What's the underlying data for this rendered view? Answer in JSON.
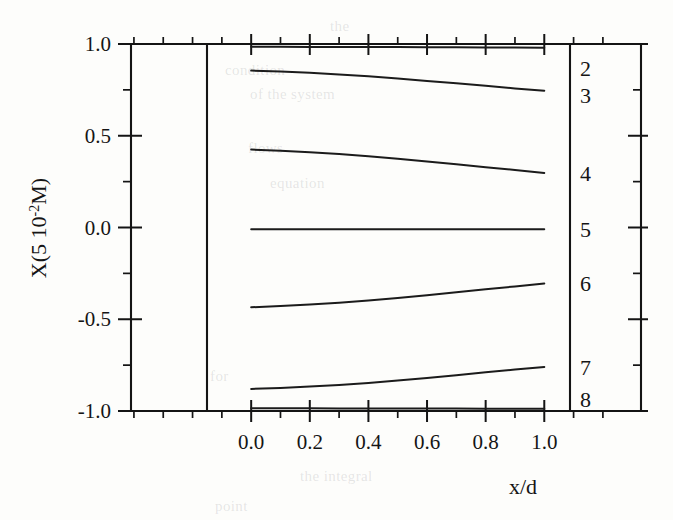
{
  "chart_data": {
    "type": "line",
    "title": "",
    "xlabel": "x/d",
    "ylabel": "X(5 10-2M)",
    "ylabel_parts": {
      "pre": "X(5 10",
      "sup": "-2",
      "post": "M)"
    },
    "xlim": [
      -0.41,
      1.33
    ],
    "ylim": [
      -1.0,
      1.0
    ],
    "x_data_range": [
      0.0,
      1.0
    ],
    "xticks": [
      0.0,
      0.2,
      0.4,
      0.6,
      0.8,
      1.0
    ],
    "xtick_labels": [
      "0.0",
      "0.2",
      "0.4",
      "0.6",
      "0.8",
      "1.0"
    ],
    "x_minor_ticks": [
      -0.4,
      -0.3,
      -0.2,
      -0.1,
      0.1,
      0.3,
      0.5,
      0.7,
      0.9,
      1.1,
      1.2
    ],
    "yticks": [
      -1.0,
      -0.5,
      0.0,
      0.5,
      1.0
    ],
    "ytick_labels": [
      "-1.0",
      "-0.5",
      "0.0",
      "0.5",
      "1.0"
    ],
    "y_minor_ticks": [
      -0.75,
      -0.25,
      0.25,
      0.75
    ],
    "grid": false,
    "legend_position": "right-inline-labels",
    "x": [
      0.0,
      0.1,
      0.2,
      0.3,
      0.4,
      0.5,
      0.6,
      0.7,
      0.8,
      0.9,
      1.0
    ],
    "series": [
      {
        "name": "2",
        "label": "2",
        "values": [
          0.985,
          0.985,
          0.984,
          0.984,
          0.983,
          0.983,
          0.982,
          0.982,
          0.981,
          0.981,
          0.98
        ]
      },
      {
        "name": "3",
        "label": "3",
        "values": [
          0.855,
          0.85,
          0.843,
          0.834,
          0.824,
          0.812,
          0.799,
          0.786,
          0.772,
          0.758,
          0.745
        ]
      },
      {
        "name": "4",
        "label": "4",
        "values": [
          0.425,
          0.418,
          0.41,
          0.4,
          0.388,
          0.375,
          0.36,
          0.345,
          0.329,
          0.313,
          0.297
        ]
      },
      {
        "name": "5",
        "label": "5",
        "values": [
          -0.01,
          -0.01,
          -0.01,
          -0.01,
          -0.01,
          -0.01,
          -0.01,
          -0.01,
          -0.01,
          -0.01,
          -0.01
        ]
      },
      {
        "name": "6",
        "label": "6",
        "values": [
          -0.435,
          -0.428,
          -0.42,
          -0.41,
          -0.398,
          -0.384,
          -0.369,
          -0.353,
          -0.337,
          -0.321,
          -0.305
        ]
      },
      {
        "name": "7",
        "label": "7",
        "values": [
          -0.88,
          -0.874,
          -0.867,
          -0.858,
          -0.847,
          -0.834,
          -0.82,
          -0.805,
          -0.789,
          -0.774,
          -0.76
        ]
      },
      {
        "name": "8",
        "label": "8",
        "values": [
          -0.985,
          -0.985,
          -0.985,
          -0.986,
          -0.986,
          -0.986,
          -0.987,
          -0.987,
          -0.988,
          -0.988,
          -0.988
        ]
      }
    ]
  },
  "background_text": [
    {
      "text": "the",
      "x": 330,
      "y": 18
    },
    {
      "text": "condition",
      "x": 225,
      "y": 62
    },
    {
      "text": "of the system",
      "x": 250,
      "y": 86
    },
    {
      "text": "flows",
      "x": 248,
      "y": 140
    },
    {
      "text": "equation",
      "x": 270,
      "y": 175
    },
    {
      "text": "for",
      "x": 210,
      "y": 368
    },
    {
      "text": "the integral",
      "x": 300,
      "y": 468
    },
    {
      "text": "point",
      "x": 215,
      "y": 498
    }
  ]
}
